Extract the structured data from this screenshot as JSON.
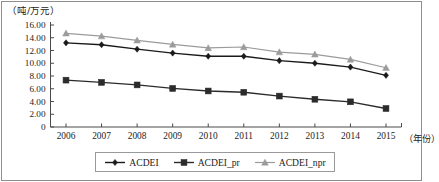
{
  "chart_data": {
    "type": "line",
    "title": "",
    "subtitle": "",
    "ylabel": "（吨/万元）",
    "xlabel": "（年份）",
    "categories": [
      "2006",
      "2007",
      "2008",
      "2009",
      "2010",
      "2011",
      "2012",
      "2013",
      "2014",
      "2015"
    ],
    "ylim": [
      0,
      16
    ],
    "ytick_labels": [
      "0",
      "2.00",
      "4.00",
      "6.00",
      "8.00",
      "10.00",
      "12.00",
      "14.00",
      "16.00"
    ],
    "ytick_values": [
      0,
      2,
      4,
      6,
      8,
      10,
      12,
      14,
      16
    ],
    "grid": false,
    "legend_position": "bottom",
    "series": [
      {
        "name": "ACDEI",
        "marker": "diamond",
        "color": "#1a1a1a",
        "values": [
          13.2,
          12.9,
          12.2,
          11.6,
          11.1,
          11.1,
          10.4,
          10.0,
          9.4,
          8.1
        ]
      },
      {
        "name": "ACDEI_pr",
        "marker": "square",
        "color": "#2b2b2b",
        "values": [
          7.35,
          7.0,
          6.6,
          6.05,
          5.65,
          5.45,
          4.85,
          4.35,
          3.95,
          2.9
        ]
      },
      {
        "name": "ACDEI_npr",
        "marker": "triangle",
        "color": "#9b9b9b",
        "values": [
          14.7,
          14.25,
          13.6,
          12.95,
          12.4,
          12.55,
          11.75,
          11.4,
          10.6,
          9.3
        ]
      }
    ]
  },
  "axes": {
    "y_axis_unit_label": "（吨/万元）",
    "x_axis_unit_label": "（年份）"
  },
  "legend": {
    "items": [
      {
        "label": "ACDEI",
        "marker": "diamond-marker-icon",
        "color": "#1a1a1a"
      },
      {
        "label": "ACDEI_pr",
        "marker": "square-marker-icon",
        "color": "#2b2b2b"
      },
      {
        "label": "ACDEI_npr",
        "marker": "triangle-marker-icon",
        "color": "#9b9b9b"
      }
    ]
  }
}
